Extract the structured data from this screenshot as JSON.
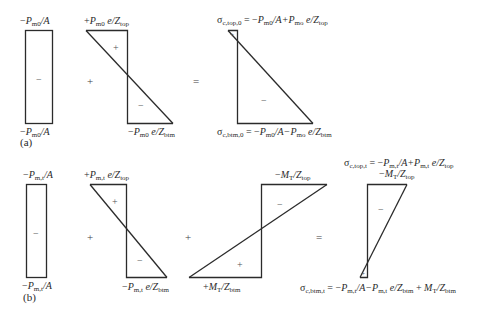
{
  "part_a": {
    "tag": "(a)",
    "axial": {
      "top_label": {
        "pre": "−",
        "var": "P",
        "sub": "m0",
        "post": "/A"
      },
      "bottom_label": {
        "pre": "−",
        "var": "P",
        "sub": "m0",
        "post": "/A"
      },
      "sign": "−"
    },
    "eccentric": {
      "top_label": {
        "pre": "+",
        "var": "P",
        "sub": "m0",
        "mid": " e/Z",
        "sub2": "top"
      },
      "bottom_label": {
        "pre": "−",
        "var": "P",
        "sub": "m0",
        "mid": " e/Z",
        "sub2": "btm"
      },
      "sign_top": "+",
      "sign_bottom": "−"
    },
    "op_plus": "+",
    "op_equals": "=",
    "result": {
      "top_label": {
        "sigma": "σ",
        "sigma_sub": "c,top,0",
        "eq": " = −",
        "var1": "P",
        "sub1": "m0",
        "mid1": "/A+",
        "var2": "P",
        "sub2": "mo",
        "mid2": " e/Z",
        "sub3": "top"
      },
      "bottom_label": {
        "sigma": "σ",
        "sigma_sub": "c,btm,0",
        "eq": " = −",
        "var1": "P",
        "sub1": "m0",
        "mid1": "/A−",
        "var2": "P",
        "sub2": "mo",
        "mid2": " e/Z",
        "sub3": "btm"
      },
      "sign_top": "+",
      "sign_main": "−"
    }
  },
  "part_b": {
    "tag": "(b)",
    "axial": {
      "top_label": {
        "pre": "−",
        "var": "P",
        "sub": "m,t",
        "post": "/A"
      },
      "bottom_label": {
        "pre": "−",
        "var": "P",
        "sub": "m,t",
        "post": "/A"
      },
      "sign": "−"
    },
    "eccentric": {
      "top_label": {
        "pre": "+",
        "var": "P",
        "sub": "m,t",
        "mid": " e/Z",
        "sub2": "top"
      },
      "bottom_label": {
        "pre": "−",
        "var": "P",
        "sub": "m,t",
        "mid": " e/Z",
        "sub2": "btm"
      },
      "sign_top": "+",
      "sign_bottom": "−"
    },
    "moment": {
      "top_label": {
        "pre": "−",
        "var": "M",
        "sub": "T",
        "mid": "/Z",
        "sub2": "top"
      },
      "bottom_label": {
        "pre": "+",
        "var": "M",
        "sub": "T",
        "mid": "/Z",
        "sub2": "btm"
      },
      "sign_top": "−",
      "sign_bottom": "+"
    },
    "op_plus_1": "+",
    "op_plus_2": "+",
    "op_equals": "=",
    "result": {
      "top_label_line1": {
        "sigma": "σ",
        "sigma_sub": "c,top,t",
        "eq": " = −",
        "var1": "P",
        "sub1": "m,t",
        "mid1": "/A+",
        "var2": "P",
        "sub2": "m,t",
        "mid2": " e/Z",
        "sub3": "top"
      },
      "top_label_line2": {
        "pre": "−",
        "var": "M",
        "sub": "T",
        "mid": "/Z",
        "sub2": "top"
      },
      "bottom_label": {
        "sigma": "σ",
        "sigma_sub": "c,btm,t",
        "eq": " = −",
        "var1": "P",
        "sub1": "m,t",
        "mid1": "/A−",
        "var2": "P",
        "sub2": "m,t",
        "mid2": " e/Z",
        "sub3": "btm",
        "tail": " + ",
        "var3": "M",
        "sub4": "T",
        "mid3": "/Z",
        "sub5": "btm"
      },
      "sign_main": "−",
      "sign_bottom": "+"
    }
  }
}
